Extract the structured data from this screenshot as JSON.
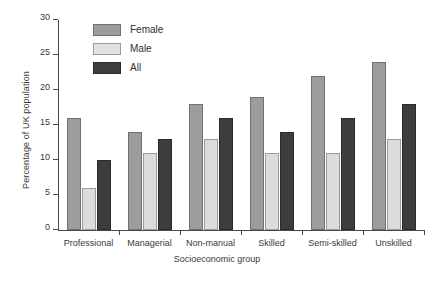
{
  "chart_data": {
    "type": "bar",
    "title": "",
    "xlabel": "Socioeconomic group",
    "ylabel": "Percentage of UK population",
    "categories": [
      "Professional",
      "Managerial",
      "Non-manual",
      "Skilled",
      "Semi-skilled",
      "Unskilled"
    ],
    "series": [
      {
        "name": "Female",
        "color": "#9d9d9d",
        "values": [
          16,
          14,
          18,
          19,
          22,
          24
        ]
      },
      {
        "name": "Male",
        "color": "#dcdcdc",
        "values": [
          6,
          11,
          13,
          11,
          11,
          13
        ]
      },
      {
        "name": "All",
        "color": "#3d3d3d",
        "values": [
          10,
          13,
          16,
          14,
          16,
          18
        ]
      }
    ],
    "ylim": [
      0,
      30
    ],
    "yticks": [
      0,
      5,
      10,
      15,
      20,
      25,
      30
    ],
    "ytick_labels": [
      "0",
      "5",
      "10",
      "15",
      "20",
      "25",
      "30"
    ],
    "grid": false,
    "legend_position": "top-left-inside"
  },
  "legend": {
    "items": [
      {
        "label": "Female",
        "swatch": "female-swatch"
      },
      {
        "label": "Male",
        "swatch": "male-swatch"
      },
      {
        "label": "All",
        "swatch": "all-swatch"
      }
    ]
  },
  "axes": {
    "y_title": "Percentage of UK population",
    "x_title": "Socioeconomic group",
    "y_ticks": [
      "0",
      "5",
      "10",
      "15",
      "20",
      "25",
      "30"
    ],
    "x_categories": [
      "Professional",
      "Managerial",
      "Non-manual",
      "Skilled",
      "Semi-skilled",
      "Unskilled"
    ]
  }
}
